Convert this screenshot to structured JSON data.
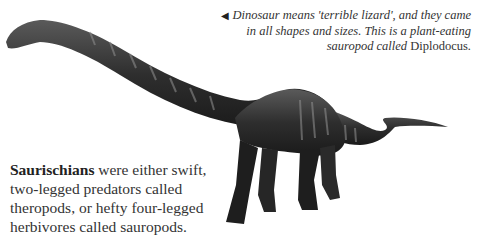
{
  "caption": {
    "arrow_icon": "◀",
    "text_italic": "Dinosaur means 'terrible lizard', and they came in all shapes and sizes. This is a plant-eating sauropod called",
    "genus": "Diplodocus",
    "end": "."
  },
  "body": {
    "term": "Saurischians",
    "text": " were either swift, two-legged predators called theropods, or hefty four-legged herbivores called sauropods."
  },
  "illustration": {
    "subject": "Diplodocus",
    "colors": {
      "dark": "#1e1e1e",
      "mid": "#4a4a4a",
      "light": "#8a8a8a"
    }
  }
}
